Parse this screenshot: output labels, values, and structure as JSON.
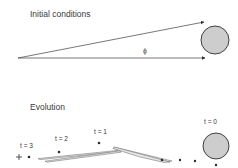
{
  "figure": {
    "width": 238,
    "height": 168,
    "background_color": "#ffffff",
    "line_color": "#3d3d3d",
    "text_color": "#3a3a3a",
    "disc_fill_color": "#cdcdcd",
    "disc_stroke_color": "#2e2e2e",
    "filament_fill_color": "#e8e8e8",
    "filament_stroke_color": "#6e6e6e"
  },
  "panels": {
    "top": {
      "title": "Initial conditions",
      "title_x": 30,
      "title_y": 17,
      "angle_label": "ϕ",
      "angle_label_x": 145,
      "angle_label_y": 53,
      "apex_x": 18,
      "apex_y": 58,
      "disc": {
        "cx": 215,
        "cy": 40,
        "r": 14
      },
      "rays": [
        {
          "name": "upper-ray",
          "x1": 18,
          "y1": 58,
          "x2": 204,
          "y2": 22
        },
        {
          "name": "lower-ray",
          "x1": 18,
          "y1": 58,
          "x2": 205,
          "y2": 58
        }
      ]
    },
    "bottom": {
      "title": "Evolution",
      "title_x": 30,
      "title_y": 110,
      "disc": {
        "cx": 216,
        "cy": 146,
        "r": 13
      },
      "time_labels": [
        {
          "text": "t = 0",
          "x": 204,
          "y": 124
        },
        {
          "text": "t = 1",
          "x": 94,
          "y": 134
        },
        {
          "text": "t = 2",
          "x": 55,
          "y": 141
        },
        {
          "text": "t = 3",
          "x": 20,
          "y": 148
        }
      ],
      "dots": [
        {
          "name": "dot-t0-lower",
          "cx": 216,
          "cy": 165,
          "r": 1.2
        },
        {
          "name": "dot-trail-a",
          "cx": 195,
          "cy": 161,
          "r": 1.2
        },
        {
          "name": "dot-trail-b",
          "cx": 180,
          "cy": 160,
          "r": 1.2
        },
        {
          "name": "dot-trail-c",
          "cx": 162,
          "cy": 160,
          "r": 1.3
        },
        {
          "name": "dot-t1",
          "cx": 99,
          "cy": 143,
          "r": 1.3
        },
        {
          "name": "dot-t2",
          "cx": 59,
          "cy": 152,
          "r": 1.3
        },
        {
          "name": "dot-t3",
          "cx": 29,
          "cy": 157,
          "r": 1.3
        }
      ],
      "plus_marker": {
        "name": "plus-marker",
        "cx": 19,
        "cy": 157,
        "size": 3
      },
      "filaments": [
        {
          "name": "filament-upper",
          "path": "M 114 147 L 172 161 L 167 161.6 Q 140 156 114 148.6 Z"
        },
        {
          "name": "filament-fold",
          "path": "M 114 147 L 170 162 L 164 162.4 Q 138 157.6 113 148.4 Z"
        },
        {
          "name": "filament-lower",
          "path": "M 38 158.6 L 118 150.4 L 119 151.6 L 40 159.6 Z"
        },
        {
          "name": "filament-lower-2",
          "path": "M 45 161.2 L 120 150.8 L 121 152.2 L 47 162.2 Z"
        }
      ]
    }
  }
}
